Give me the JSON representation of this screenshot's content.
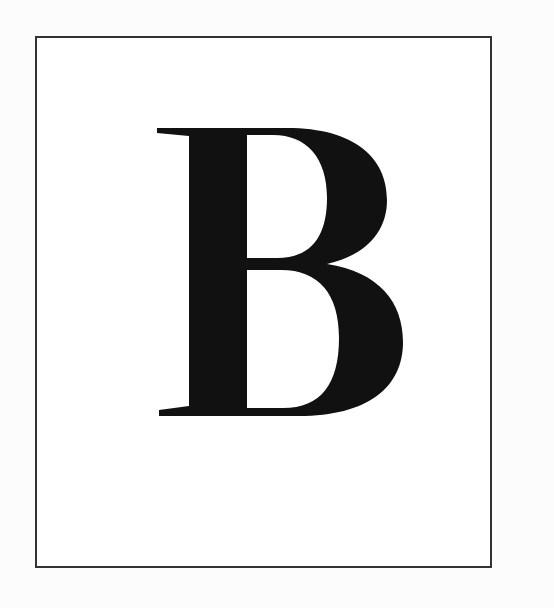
{
  "card": {
    "letter": "B",
    "letter_color": "#111111",
    "border_color": "#333333",
    "background": "#ffffff"
  }
}
